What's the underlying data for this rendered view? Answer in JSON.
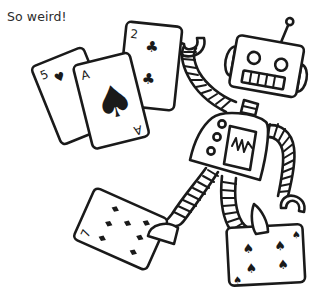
{
  "caption": "So weird!",
  "illustration": {
    "subject": "robot juggling playing cards",
    "cards": [
      {
        "rank": "5",
        "suit": "heart-icon"
      },
      {
        "rank": "A",
        "suit": "spade-icon"
      },
      {
        "rank": "2",
        "suit": "club-icon"
      },
      {
        "rank": "7",
        "suit": "diamond-icon"
      },
      {
        "rank": "4",
        "suit": "spade-icon"
      }
    ],
    "labels": {
      "card_five_rank": "5",
      "card_ace_rank": "A",
      "card_ace_rank_bottom": "A",
      "card_two_rank": "2",
      "card_seven_rank": "7",
      "card_four_rank": "4",
      "card_four_rank_bottom": "4"
    },
    "colors": {
      "ink": "#1a1a1a",
      "paper": "#ffffff",
      "caption": "#2b2b2b"
    }
  }
}
